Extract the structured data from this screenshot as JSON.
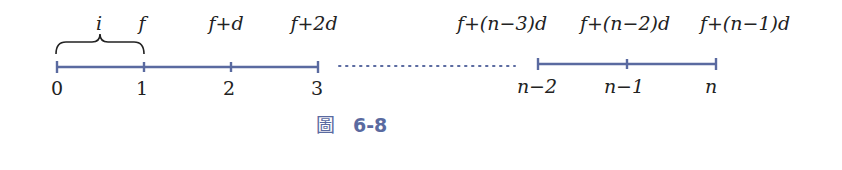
{
  "diagram": {
    "top_labels": [
      "i",
      "f",
      "f+d",
      "f+2d",
      "f+(n−3)d",
      "f+(n−2)d",
      "f+(n−1)d"
    ],
    "bottom_labels": [
      "0",
      "1",
      "2",
      "3",
      "n−2",
      "n−1",
      "n"
    ],
    "line_color": "#5a6aa0",
    "caption_icon": "圖",
    "caption": "6-8"
  }
}
